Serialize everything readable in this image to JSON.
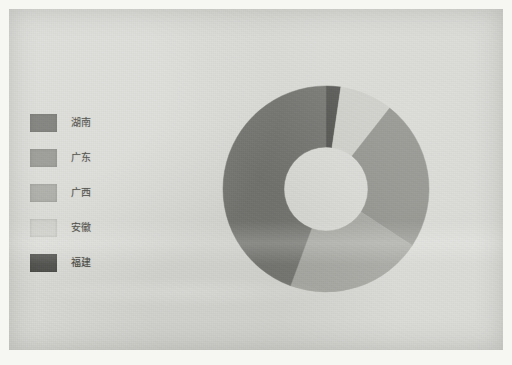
{
  "figure": {
    "type": "donut-chart",
    "background_color": "#d8d9d4",
    "border_color": "#f6f6f3"
  },
  "legend": {
    "position": "left",
    "items": [
      {
        "label": "湖南",
        "color": "#6e6f6a",
        "swatch_name": "legend-swatch-hunan"
      },
      {
        "label": "广东",
        "color": "#8d8e88",
        "swatch_name": "legend-swatch-guangdong"
      },
      {
        "label": "广西",
        "color": "#a4a59f",
        "swatch_name": "legend-swatch-guangxi"
      },
      {
        "label": "安徽",
        "color": "#cccdc7",
        "swatch_name": "legend-swatch-anhui"
      },
      {
        "label": "福建",
        "color": "#4b4c48",
        "swatch_name": "legend-swatch-fujian"
      }
    ]
  },
  "chart_data": {
    "type": "pie",
    "variant": "donut",
    "title": "",
    "subtitle": "",
    "xlabel": "",
    "ylabel": "",
    "legend_position": "left",
    "grid": false,
    "start_angle_deg": 0,
    "direction": "clockwise",
    "inner_radius_ratio": 0.41,
    "center": {
      "cx": 112,
      "cy": 112
    },
    "outer_radius": 103,
    "inner_radius": 42,
    "categories": [
      "湖南",
      "广东",
      "广西",
      "安徽",
      "福建"
    ],
    "values": [
      44.4,
      23.6,
      21.4,
      8.3,
      2.3
    ],
    "unit": "%",
    "slices": [
      {
        "label": "福建",
        "value": 2.3,
        "angle_deg": 8.3,
        "start_deg": 0.0,
        "end_deg": 8.3,
        "color": "#4b4c48"
      },
      {
        "label": "安徽",
        "value": 8.3,
        "angle_deg": 29.9,
        "start_deg": 8.3,
        "end_deg": 38.2,
        "color": "#cccdc7"
      },
      {
        "label": "广东",
        "value": 23.6,
        "angle_deg": 85.0,
        "start_deg": 38.2,
        "end_deg": 123.2,
        "color": "#8d8e88"
      },
      {
        "label": "广西",
        "value": 21.4,
        "angle_deg": 77.0,
        "start_deg": 123.2,
        "end_deg": 200.2,
        "color": "#a4a59f"
      },
      {
        "label": "湖南",
        "value": 44.4,
        "angle_deg": 159.8,
        "start_deg": 200.2,
        "end_deg": 360.0,
        "color": "#6e6f6a"
      }
    ]
  }
}
